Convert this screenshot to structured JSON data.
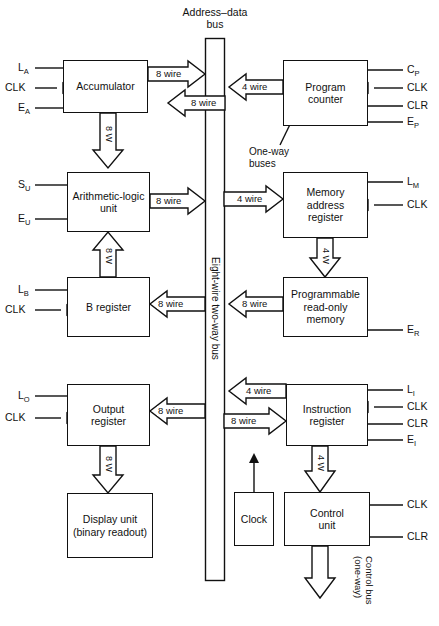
{
  "diagram": {
    "title_top": "Address–data",
    "title_top2": "bus",
    "bus_label": "Eight-wire two-way bus",
    "oneway_label_1": "One-way",
    "oneway_label_2": "buses",
    "control_bus_1": "Control bus",
    "control_bus_2": "(one-way)"
  },
  "blocks": {
    "accumulator": "Accumulator",
    "alu_line1": "Arithmetic-logic",
    "alu_line2": "unit",
    "b_register": "B register",
    "output_register_1": "Output",
    "output_register_2": "register",
    "display_unit_1": "Display unit",
    "display_unit_2": "(binary readout)",
    "program_counter_1": "Program",
    "program_counter_2": "counter",
    "mar_1": "Memory",
    "mar_2": "address",
    "mar_3": "register",
    "prom_1": "Programmable",
    "prom_2": "read-only",
    "prom_3": "memory",
    "instruction_register_1": "Instruction",
    "instruction_register_2": "register",
    "clock": "Clock",
    "control_unit_1": "Control",
    "control_unit_2": "unit"
  },
  "signals": {
    "accumulator": [
      "L",
      "CLK",
      "E"
    ],
    "accumulator_subs": [
      "A",
      "",
      "A"
    ],
    "alu": [
      "S",
      "E"
    ],
    "alu_subs": [
      "U",
      "U"
    ],
    "b_register": [
      "L",
      "CLK"
    ],
    "b_register_subs": [
      "B",
      ""
    ],
    "output_register": [
      "L",
      "CLK"
    ],
    "output_register_subs": [
      "O",
      ""
    ],
    "program_counter": [
      "C",
      "CLK",
      "CLR",
      "E"
    ],
    "program_counter_subs": [
      "P",
      "",
      "",
      "P"
    ],
    "mar": [
      "L",
      "CLK"
    ],
    "mar_subs": [
      "M",
      ""
    ],
    "prom": [
      "E"
    ],
    "prom_subs": [
      "R"
    ],
    "instruction_register": [
      "L",
      "CLK",
      "CLR",
      "E"
    ],
    "instruction_register_subs": [
      "I",
      "",
      "",
      "I"
    ],
    "control_unit": [
      "CLK",
      "CLR"
    ],
    "control_unit_subs": [
      "",
      ""
    ]
  },
  "bus_widths": {
    "acc_out": "8 wire",
    "acc_in": "8 wire",
    "acc_to_alu": "8 W",
    "alu_out": "8 wire",
    "b_to_alu": "8 W",
    "b_in": "8 wire",
    "out_in": "8 wire",
    "out_to_display": "8 W",
    "pc_bus": "4 wire",
    "mar_bus": "4 wire",
    "mar_to_prom": "4 W",
    "prom_out": "8 wire",
    "ir_out": "4 wire",
    "ir_in": "8 wire",
    "ir_to_cu": "4 W"
  },
  "colors": {
    "line": "#111111",
    "background": "#ffffff"
  }
}
